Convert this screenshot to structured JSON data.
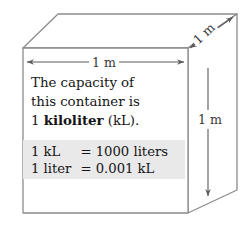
{
  "figure": {
    "shape": "cube",
    "line_color": "#8c8c8c",
    "text_color": "#161616",
    "highlight_color": "#e9e9e9",
    "background_color": "#ffffff"
  },
  "dimensions": {
    "width_label": "1 m",
    "height_label": "1 m",
    "depth_label": "1 m"
  },
  "caption": {
    "line1": "The capacity of",
    "line2": "this container is",
    "line3_prefix": "1 ",
    "line3_bold": "kiloliter",
    "line3_suffix": " (kL)."
  },
  "conversions": {
    "rows": [
      {
        "left": "1 kL",
        "right": "= 1000 liters"
      },
      {
        "left": "1 liter",
        "right": "= 0.001 kL"
      }
    ]
  }
}
